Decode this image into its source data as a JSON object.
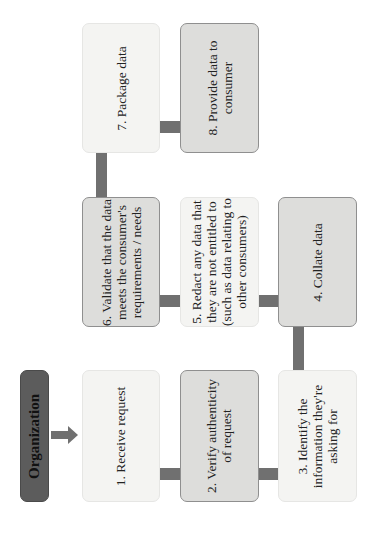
{
  "organization": {
    "label": "Organization"
  },
  "steps": [
    {
      "id": 1,
      "label": "1. Receive request",
      "style": "light"
    },
    {
      "id": 2,
      "label": "2. Verify authenticity\nof request",
      "style": "dark"
    },
    {
      "id": 3,
      "label": "3. Identify the\ninformation they're\nasking for",
      "style": "light"
    },
    {
      "id": 4,
      "label": "4. Collate data",
      "style": "dark"
    },
    {
      "id": 5,
      "label": "5. Redact any data that\nthey are not entitled to\n(such as data relating to\nother consumers)",
      "style": "light"
    },
    {
      "id": 6,
      "label": "6. Validate that the data\nmeets the consumer's\nrequirements / needs",
      "style": "dark"
    },
    {
      "id": 7,
      "label": "7. Package data",
      "style": "light"
    },
    {
      "id": 8,
      "label": "8. Provide data to\nconsumer",
      "style": "dark"
    }
  ],
  "colors": {
    "connector": "#707070",
    "light_box": "#f4f4f2",
    "dark_box": "#dddddb",
    "org_box": "#5c5c5c"
  }
}
